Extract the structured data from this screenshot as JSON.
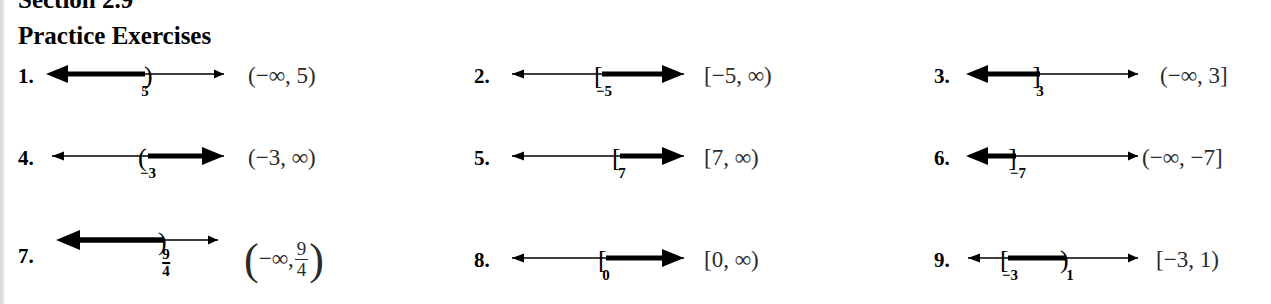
{
  "page": {
    "section_heading": "Section 2.9",
    "practice_heading": "Practice Exercises",
    "background": "#ffffff",
    "ink": "#000000"
  },
  "problems": [
    {
      "number": "1.",
      "interval": "(-∞, 5)",
      "interval_parts": {
        "prefix": "(−∞, 5)"
      },
      "tick_labels": [
        "5"
      ],
      "shading": "left-ray",
      "endpoints": [
        {
          "value": "5",
          "bracket": ")",
          "type": "open"
        }
      ]
    },
    {
      "number": "2.",
      "interval": "[-5, ∞)",
      "interval_parts": {
        "prefix": "[−5, ∞)"
      },
      "tick_labels": [
        "−5"
      ],
      "shading": "right-ray",
      "endpoints": [
        {
          "value": "-5",
          "bracket": "[",
          "type": "closed"
        }
      ]
    },
    {
      "number": "3.",
      "interval": "(-∞, 3]",
      "interval_parts": {
        "prefix": "(−∞, 3]"
      },
      "tick_labels": [
        "3"
      ],
      "shading": "left-ray",
      "endpoints": [
        {
          "value": "3",
          "bracket": "]",
          "type": "closed"
        }
      ]
    },
    {
      "number": "4.",
      "interval": "(-3, ∞)",
      "interval_parts": {
        "prefix": "(−3, ∞)"
      },
      "tick_labels": [
        "−3"
      ],
      "shading": "right-ray",
      "endpoints": [
        {
          "value": "-3",
          "bracket": "(",
          "type": "open"
        }
      ]
    },
    {
      "number": "5.",
      "interval": "[7, ∞)",
      "interval_parts": {
        "prefix": "[7, ∞)"
      },
      "tick_labels": [
        "7"
      ],
      "shading": "right-ray",
      "endpoints": [
        {
          "value": "7",
          "bracket": "[",
          "type": "closed"
        }
      ]
    },
    {
      "number": "6.",
      "interval": "(-∞, -7]",
      "interval_parts": {
        "prefix": "(−∞, −7]"
      },
      "tick_labels": [
        "−7"
      ],
      "shading": "left-ray",
      "endpoints": [
        {
          "value": "-7",
          "bracket": "]",
          "type": "closed"
        }
      ]
    },
    {
      "number": "7.",
      "interval": "(-∞, 9/4)",
      "interval_parts": {
        "open_paren": "(",
        "left": "−∞,",
        "frac_num": "9",
        "frac_den": "4",
        "close_paren": ")"
      },
      "tick_labels": [
        "9/4"
      ],
      "tick_frac": {
        "num": "9",
        "den": "4"
      },
      "shading": "left-ray",
      "endpoints": [
        {
          "value": "9/4",
          "bracket": ")",
          "type": "open"
        }
      ]
    },
    {
      "number": "8.",
      "interval": "[0, ∞)",
      "interval_parts": {
        "prefix": "[0, ∞)"
      },
      "tick_labels": [
        "0"
      ],
      "shading": "right-ray",
      "endpoints": [
        {
          "value": "0",
          "bracket": "[",
          "type": "closed"
        }
      ]
    },
    {
      "number": "9.",
      "interval": "[-3, 1)",
      "interval_parts": {
        "prefix": "[−3, 1)"
      },
      "tick_labels": [
        "−3",
        "1"
      ],
      "shading": "segment",
      "endpoints": [
        {
          "value": "-3",
          "bracket": "[",
          "type": "closed"
        },
        {
          "value": "1",
          "bracket": ")",
          "type": "open"
        }
      ]
    }
  ]
}
